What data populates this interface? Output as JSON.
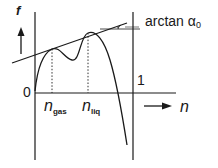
{
  "diagram": {
    "axes": {
      "y_label": "f",
      "x_label": "n",
      "origin_label": "0",
      "right_boundary_label": "1"
    },
    "annotations": {
      "tangent_slope_label": "arctan α",
      "tangent_slope_subscript": "0",
      "n_gas_base": "n",
      "n_gas_sub": "gas",
      "n_liq_base": "n",
      "n_liq_sub": "liq"
    },
    "colors": {
      "stroke": "#1a1a1a",
      "background": "#ffffff"
    }
  }
}
